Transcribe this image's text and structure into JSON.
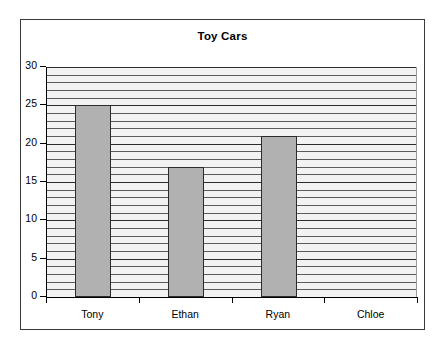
{
  "chart_data": {
    "type": "bar",
    "title": "Toy Cars",
    "xlabel": "",
    "ylabel": "",
    "categories": [
      "Tony",
      "Ethan",
      "Ryan",
      "Chloe"
    ],
    "values": [
      25,
      17,
      21,
      0
    ],
    "ylim": [
      0,
      30
    ],
    "y_ticks": [
      0,
      5,
      10,
      15,
      20,
      25,
      30
    ],
    "y_tick_labels": [
      "0",
      "5",
      "10",
      "15",
      "20",
      "25",
      "30"
    ],
    "grid": {
      "horizontal": true,
      "minor_step": 1,
      "major_step": 5,
      "vertical": false
    },
    "legend": {
      "visible": false,
      "position": "none"
    },
    "colors": {
      "bar_fill": "#b1b1b1",
      "bar_border": "#2b2b2b",
      "plot_background": "#f2f2f2",
      "gridline": "#5b5b5b",
      "gridline_major": "#2c2c2c",
      "axis": "#000000",
      "frame_border": "#3a3a3a",
      "page_background": "#ffffff",
      "text": "#000000"
    }
  }
}
